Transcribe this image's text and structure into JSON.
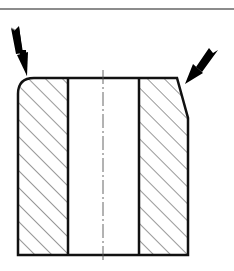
{
  "figure": {
    "colors": {
      "background": "#ffffff",
      "outline": "#111111",
      "hatch": "#333333",
      "frame_line": "#666666",
      "centerline": "#555555",
      "arrow": "#000000"
    },
    "elements": {
      "frame_line": "top border line",
      "section_left": "hatched wall section (left)",
      "section_right": "hatched wall section (right)",
      "bore": "central bore",
      "centerline": "axis centerline (dash-dot)",
      "arrow_left": "arrow pointing to rounded top-left edge",
      "arrow_right": "arrow pointing to chamfered top-right edge"
    }
  }
}
